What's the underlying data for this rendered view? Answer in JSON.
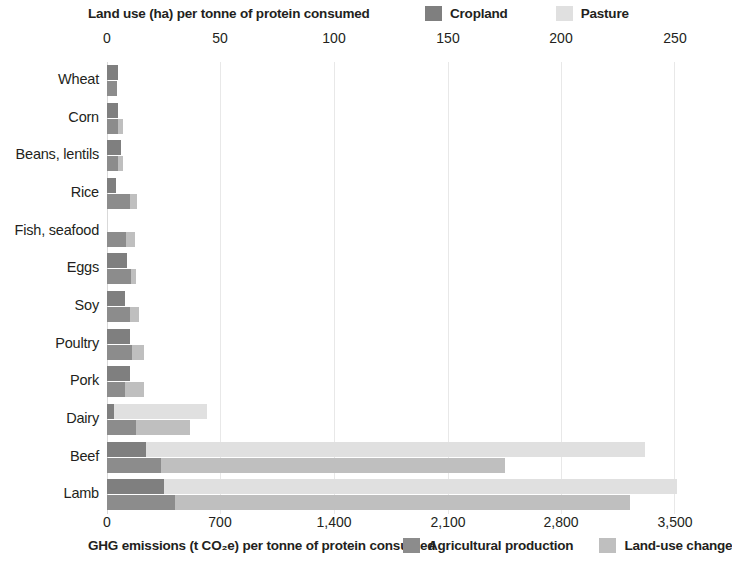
{
  "top": {
    "axis_title": "Land use (ha) per tonne of protein consumed",
    "legend": [
      {
        "label": "Cropland",
        "color": "#7f7f7f"
      },
      {
        "label": "Pasture",
        "color": "#e0e0e0"
      }
    ],
    "ticks": [
      "0",
      "50",
      "100",
      "150",
      "200",
      "250"
    ]
  },
  "bottom": {
    "axis_title": "GHG emissions (t CO₂e) per tonne of protein consumed",
    "legend": [
      {
        "label": "Agricultural production",
        "color": "#8c8c8c"
      },
      {
        "label": "Land-use change",
        "color": "#bfbfbf"
      }
    ],
    "ticks": [
      "0",
      "700",
      "1,400",
      "2,100",
      "2,800",
      "3,500"
    ]
  },
  "chart_data": {
    "type": "bar",
    "title": "",
    "orientation": "horizontal",
    "grid": true,
    "categories": [
      "Wheat",
      "Corn",
      "Beans, lentils",
      "Rice",
      "Fish, seafood",
      "Eggs",
      "Soy",
      "Poultry",
      "Pork",
      "Dairy",
      "Beef",
      "Lamb"
    ],
    "axes": [
      {
        "id": "land_use",
        "position": "top",
        "label": "Land use (ha) per tonne of protein consumed",
        "unit": "ha",
        "range": [
          0,
          250
        ],
        "ticks": [
          0,
          50,
          100,
          150,
          200,
          250
        ]
      },
      {
        "id": "ghg",
        "position": "bottom",
        "label": "GHG emissions (t CO2e) per tonne of protein consumed",
        "unit": "t CO2e",
        "range": [
          0,
          3500
        ],
        "ticks": [
          0,
          700,
          1400,
          2100,
          2800,
          3500
        ]
      }
    ],
    "series": [
      {
        "name": "Cropland",
        "axis": "land_use",
        "color": "#7f7f7f",
        "values": [
          5,
          5,
          6,
          4,
          0,
          9,
          8,
          10,
          10,
          3,
          17,
          25
        ]
      },
      {
        "name": "Pasture",
        "axis": "land_use",
        "color": "#e0e0e0",
        "values": [
          0,
          0,
          0,
          0,
          0,
          0,
          0,
          0,
          0,
          41,
          220,
          226
        ]
      },
      {
        "name": "Agricultural production",
        "axis": "ghg",
        "color": "#8c8c8c",
        "values": [
          60,
          70,
          65,
          140,
          120,
          150,
          140,
          155,
          110,
          180,
          330,
          420
        ]
      },
      {
        "name": "Land-use change",
        "axis": "ghg",
        "color": "#bfbfbf",
        "values": [
          0,
          30,
          35,
          45,
          50,
          30,
          55,
          70,
          120,
          330,
          2120,
          2800
        ]
      }
    ],
    "legend_position": [
      "top-right",
      "bottom-right"
    ]
  }
}
